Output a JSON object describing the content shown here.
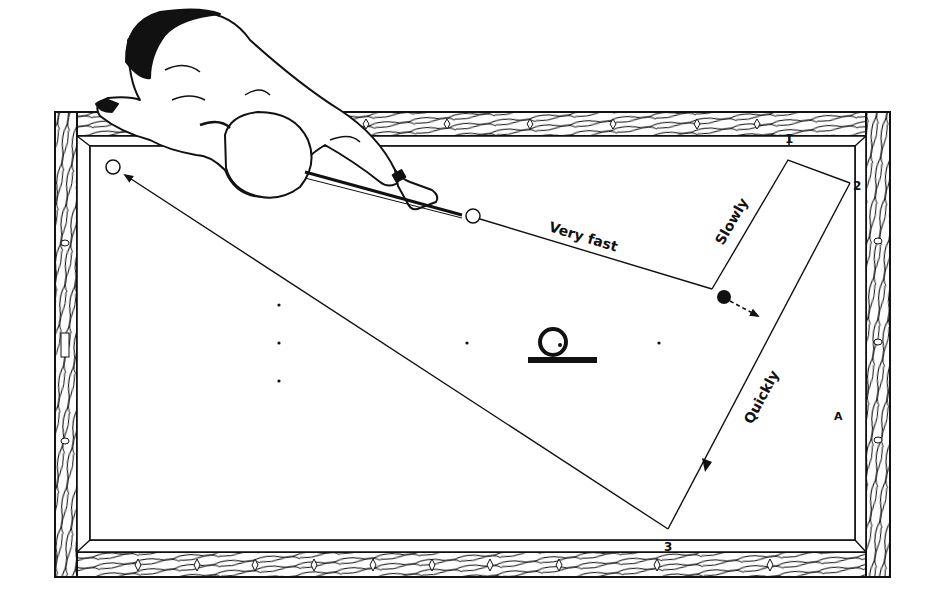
{
  "diagram": {
    "colors": {
      "ink": "#111111",
      "paper": "#ffffff"
    },
    "labels": {
      "very_fast": "Very fast",
      "slowly": "Slowly",
      "quickly": "Quickly",
      "marker_a": "A"
    },
    "rail_numbers": {
      "one": "1",
      "two": "2",
      "three": "3"
    },
    "balls": {
      "cue_ball": {
        "x": 473,
        "y": 216,
        "r": 7
      },
      "object_ball_black": {
        "x": 724,
        "y": 297,
        "r": 7
      },
      "target_ball": {
        "x": 113,
        "y": 167,
        "r": 7
      }
    },
    "spots": [
      {
        "x": 279,
        "y": 305
      },
      {
        "x": 279,
        "y": 343
      },
      {
        "x": 279,
        "y": 381
      },
      {
        "x": 467,
        "y": 343
      },
      {
        "x": 659,
        "y": 343
      }
    ],
    "legend_symbol": "ball-on-line symbol"
  }
}
